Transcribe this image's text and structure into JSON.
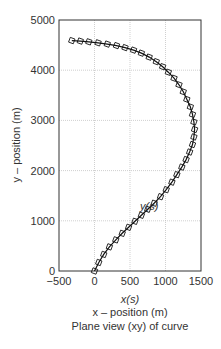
{
  "chart_data": {
    "type": "line",
    "title": "Plane view (xy) of curve",
    "xlabel": "x – position (m)",
    "xsublabel": "x(s)",
    "ylabel": "y – position (m)",
    "annotation": "y(s)",
    "xlim": [
      -500,
      1500
    ],
    "ylim": [
      0,
      5000
    ],
    "xticks": [
      "-500",
      "0",
      "500",
      "1000",
      "1500"
    ],
    "yticks": [
      "0",
      "1000",
      "2000",
      "3000",
      "4000",
      "5000"
    ],
    "grid": true,
    "marker": "square",
    "series": [
      {
        "name": "y(s)",
        "x": [
          0,
          60,
          130,
          210,
          300,
          390,
          480,
          570,
          660,
          750,
          840,
          930,
          1010,
          1090,
          1160,
          1230,
          1290,
          1340,
          1380,
          1400,
          1410,
          1400,
          1380,
          1350,
          1300,
          1250,
          1190,
          1120,
          1040,
          960,
          870,
          770,
          660,
          550,
          430,
          310,
          180,
          50,
          -80,
          -200,
          -320
        ],
        "y": [
          0,
          170,
          330,
          480,
          620,
          750,
          870,
          990,
          1110,
          1230,
          1350,
          1480,
          1620,
          1770,
          1920,
          2070,
          2220,
          2370,
          2520,
          2670,
          2820,
          2970,
          3120,
          3270,
          3420,
          3570,
          3710,
          3840,
          3960,
          4070,
          4170,
          4260,
          4340,
          4400,
          4450,
          4490,
          4520,
          4545,
          4565,
          4580,
          4590
        ]
      }
    ]
  },
  "labels": {
    "xsub": "x(s)",
    "xaxis": "x – position (m)",
    "caption": "Plane view (xy) of curve",
    "yaxis": "y – position (m)",
    "annotation": "y(s)"
  }
}
